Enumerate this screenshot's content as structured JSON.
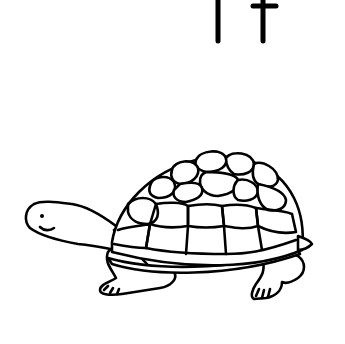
{
  "worksheet": {
    "letter_upper": "T",
    "letter_lower": "t",
    "subject": "turtle",
    "colors": {
      "background": "#ffffff",
      "ink": "#000000"
    }
  }
}
